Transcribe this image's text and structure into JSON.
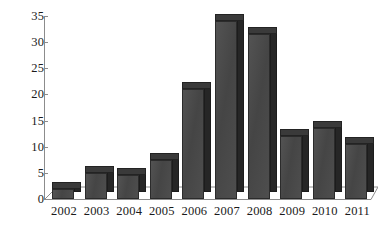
{
  "chart_data": {
    "type": "bar",
    "title": "",
    "subtitle": "",
    "xlabel": "",
    "ylabel": "",
    "categories": [
      "2002",
      "2003",
      "2004",
      "2005",
      "2006",
      "2007",
      "2008",
      "2009",
      "2010",
      "2011"
    ],
    "values": [
      2,
      5,
      4.5,
      7.5,
      21,
      34,
      31.5,
      12,
      13.5,
      10.5
    ],
    "series": [
      {
        "name": "",
        "values": [
          2,
          5,
          4.5,
          7.5,
          21,
          34,
          31.5,
          12,
          13.5,
          10.5
        ]
      }
    ],
    "ylim": [
      0,
      35
    ],
    "y_ticks": [
      "0",
      "5",
      "10",
      "15",
      "20",
      "25",
      "30",
      "35"
    ],
    "y_tick_values": [
      0,
      5,
      10,
      15,
      20,
      25,
      30,
      35
    ],
    "x_ticks": [
      "2002",
      "2003",
      "2004",
      "2005",
      "2006",
      "2007",
      "2008",
      "2009",
      "2010",
      "2011"
    ],
    "grid": false,
    "legend": false,
    "legend_position": "none",
    "style": "3d-column",
    "colors": {
      "bar_front": "#4a4a4a",
      "bar_side": "#262626",
      "bar_top": "#3a3a3a",
      "axis": "#8c8c8c",
      "text": "#1a1a1a",
      "background": "#ffffff"
    },
    "annotations": []
  }
}
